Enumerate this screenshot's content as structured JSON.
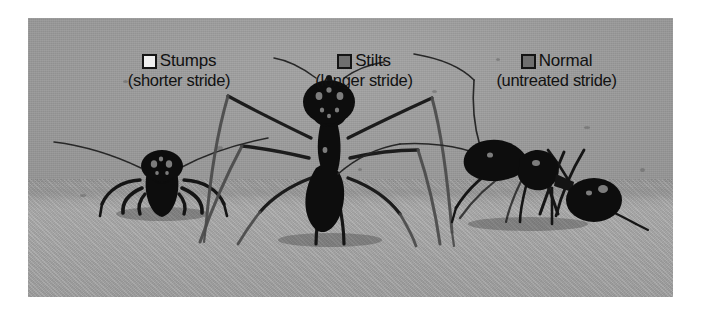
{
  "figure": {
    "kind": "photograph-with-legend",
    "caption_band_position": "top",
    "photo_background_color": "#9a9a9a",
    "photo_ground_color": "#ababab",
    "page_background_color": "#ffffff",
    "text_color": "#111111"
  },
  "legend": {
    "items": [
      {
        "label": "Stumps",
        "sublabel": "(shorter stride)",
        "swatch_color": "#efefef",
        "swatch_border_color": "#141414",
        "swatch_name": "legend-swatch-stumps"
      },
      {
        "label": "Stilts",
        "sublabel": "(longer stride)",
        "swatch_color": "#6f6f6f",
        "swatch_border_color": "#141414",
        "swatch_name": "legend-swatch-stilts"
      },
      {
        "label": "Normal",
        "sublabel": "(untreated stride)",
        "swatch_color": "#6f6f6f",
        "swatch_border_color": "#141414",
        "swatch_name": "legend-swatch-normal"
      }
    ]
  },
  "subjects": [
    {
      "name": "ant-stumps",
      "group": "Stumps",
      "pose": "front-facing",
      "description": "dark ant facing camera, legs shortened"
    },
    {
      "name": "ant-stilts",
      "group": "Stilts",
      "pose": "front-facing-elevated",
      "description": "dark ant raised high on elongated legs"
    },
    {
      "name": "ant-normal",
      "group": "Normal",
      "pose": "side-profile",
      "description": "dark ant in side view with untreated legs"
    }
  ]
}
